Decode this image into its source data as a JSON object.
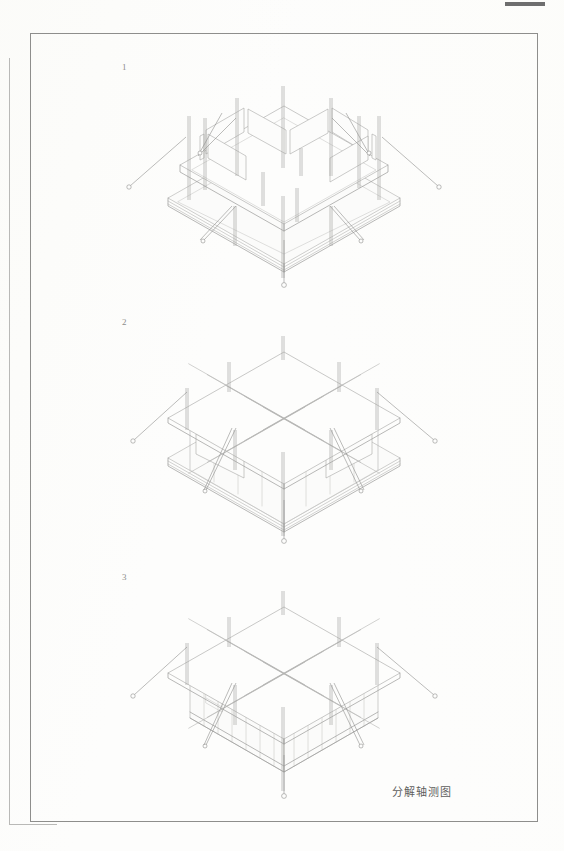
{
  "sheet": {
    "title": "分解轴测图",
    "background_color": "#fdfdfc",
    "frame_color": "#8e8e8c",
    "line_color": "#9a9a98",
    "edge_mark_color": "#6e6e6e",
    "binding_line_color": "#b9b9b7"
  },
  "figures": [
    {
      "number": "1",
      "caption": "",
      "stage": "structural frame with perimeter ring beams and columns",
      "leader_count": 8
    },
    {
      "number": "2",
      "caption": "",
      "stage": "frame with grid lattice roof added",
      "leader_count": 7
    },
    {
      "number": "3",
      "caption": "",
      "stage": "completed enclosure with wall cladding",
      "leader_count": 7
    }
  ]
}
